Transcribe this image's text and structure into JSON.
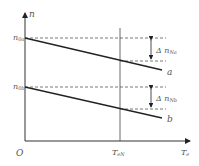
{
  "diagram": {
    "y_axis_label": "n",
    "x_axis_label": "T",
    "x_axis_sub": "e",
    "origin_label": "O",
    "n0a_main": "n",
    "n0a_sub": "0a",
    "n0b_main": "n",
    "n0b_sub": "0b",
    "delta_a_main": "Δ n",
    "delta_a_sub": "Na",
    "delta_b_main": "Δ n",
    "delta_b_sub": "Nb",
    "line_a_label": "a",
    "line_b_label": "b",
    "ten_main": "T",
    "ten_sub": "eN"
  }
}
